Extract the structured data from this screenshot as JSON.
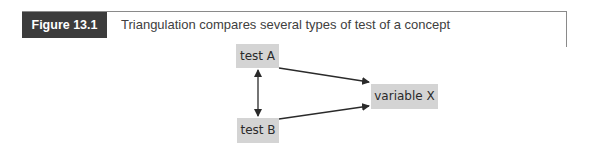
{
  "figure": {
    "label": "Figure 13.1",
    "title": "Triangulation compares several types of test of a concept"
  },
  "diagram": {
    "nodes": [
      {
        "id": "test-a",
        "label": "test A"
      },
      {
        "id": "test-b",
        "label": "test B"
      },
      {
        "id": "variable-x",
        "label": "variable X"
      }
    ],
    "edges": [
      {
        "from": "test A",
        "to": "variable X",
        "type": "directed"
      },
      {
        "from": "test B",
        "to": "variable X",
        "type": "directed"
      },
      {
        "from": "test A",
        "to": "test B",
        "type": "bidirectional"
      }
    ],
    "colors": {
      "label_bg": "#3c3c3c",
      "node_bg": "#d4d4d4",
      "rule": "#8a8a8a"
    }
  }
}
